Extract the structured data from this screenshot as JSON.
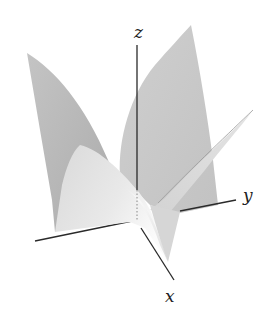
{
  "figure": {
    "type": "3d-surface-plot",
    "axes": {
      "x": {
        "label": "x"
      },
      "y": {
        "label": "y"
      },
      "z": {
        "label": "z"
      }
    },
    "colors": {
      "background": "#ffffff",
      "surface_dark": "#b5b5b5",
      "surface_mid": "#cacaca",
      "surface_light": "#e4e4e4",
      "highlight": "#f7f7f7",
      "axis": "#2a2a2a"
    }
  }
}
